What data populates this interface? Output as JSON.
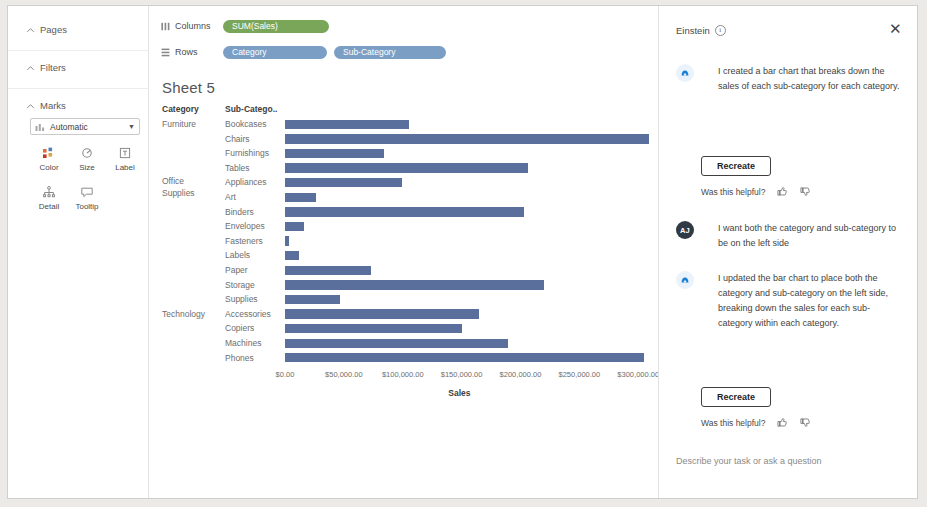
{
  "sidebar": {
    "sections": [
      {
        "label": "Pages"
      },
      {
        "label": "Filters"
      },
      {
        "label": "Marks"
      }
    ],
    "marks_type": "Automatic",
    "mark_buttons": [
      {
        "label": "Color",
        "icon": "color-icon"
      },
      {
        "label": "Size",
        "icon": "size-icon"
      },
      {
        "label": "Label",
        "icon": "label-icon"
      },
      {
        "label": "Detail",
        "icon": "detail-icon"
      },
      {
        "label": "Tooltip",
        "icon": "tooltip-icon"
      }
    ]
  },
  "shelves": {
    "columns_label": "Columns",
    "rows_label": "Rows",
    "columns_pills": [
      {
        "text": "SUM(Sales)",
        "color": "#7aa65a"
      }
    ],
    "rows_pills": [
      {
        "text": "Category",
        "color": "#7b9ec4"
      },
      {
        "text": "Sub-Category",
        "color": "#7b9ec4"
      }
    ]
  },
  "sheet": {
    "title": "Sheet 5",
    "header_category": "Category",
    "header_subcategory": "Sub-Catego.."
  },
  "chart_data": {
    "type": "bar",
    "title": "Sheet 5",
    "orientation": "horizontal",
    "xlabel": "Sales",
    "ylabel": "",
    "xlim": [
      0,
      310000
    ],
    "grid": false,
    "legend": false,
    "bar_color": "#5b6f9c",
    "tick_labels": [
      "$0.00",
      "$50,000.00",
      "$100,000.00",
      "$150,000.00",
      "$200,000.00",
      "$250,000.00",
      "$300,000.00"
    ],
    "tick_values": [
      0,
      50000,
      100000,
      150000,
      200000,
      250000,
      300000
    ],
    "group_field": "Category",
    "category_field": "Sub-Category",
    "rows": [
      {
        "category": "Furniture",
        "subcategory": "Bookcases",
        "value": 105000
      },
      {
        "category": "Furniture",
        "subcategory": "Chairs",
        "value": 309000
      },
      {
        "category": "Furniture",
        "subcategory": "Furnishings",
        "value": 84000
      },
      {
        "category": "Furniture",
        "subcategory": "Tables",
        "value": 206000
      },
      {
        "category": "Office Supplies",
        "subcategory": "Appliances",
        "value": 99000
      },
      {
        "category": "Office Supplies",
        "subcategory": "Art",
        "value": 26000
      },
      {
        "category": "Office Supplies",
        "subcategory": "Binders",
        "value": 203000
      },
      {
        "category": "Office Supplies",
        "subcategory": "Envelopes",
        "value": 16000
      },
      {
        "category": "Office Supplies",
        "subcategory": "Fasteners",
        "value": 3000
      },
      {
        "category": "Office Supplies",
        "subcategory": "Labels",
        "value": 12000
      },
      {
        "category": "Office Supplies",
        "subcategory": "Paper",
        "value": 73000
      },
      {
        "category": "Office Supplies",
        "subcategory": "Storage",
        "value": 220000
      },
      {
        "category": "Office Supplies",
        "subcategory": "Supplies",
        "value": 47000
      },
      {
        "category": "Technology",
        "subcategory": "Accessories",
        "value": 165000
      },
      {
        "category": "Technology",
        "subcategory": "Copiers",
        "value": 150000
      },
      {
        "category": "Technology",
        "subcategory": "Machines",
        "value": 189000
      },
      {
        "category": "Technology",
        "subcategory": "Phones",
        "value": 305000
      }
    ]
  },
  "einstein": {
    "title": "Einstein",
    "close_label": "✕",
    "messages": [
      {
        "role": "assistant",
        "avatar": "einstein-avatar",
        "text": "I created a bar chart that breaks down the sales of each sub-category for each category.",
        "recreate_label": "Recreate",
        "feedback_label": "Was this helpful?"
      },
      {
        "role": "user",
        "avatar": "AJ",
        "text": "I want both the category and sub-category to be on the left side"
      },
      {
        "role": "assistant",
        "avatar": "einstein-avatar",
        "text": "I updated the bar chart to place both the category and sub-category on the left side, breaking down the sales for each sub-category within each category.",
        "recreate_label": "Recreate",
        "feedback_label": "Was this helpful?"
      }
    ],
    "composer_placeholder": "Describe your task or ask a question"
  }
}
